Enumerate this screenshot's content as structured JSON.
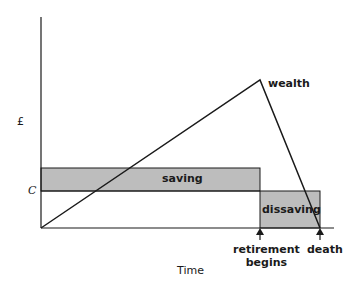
{
  "diagram": {
    "y_axis_label": "£",
    "x_axis_label": "Time",
    "consumption_label": "C",
    "wealth_label": "wealth",
    "saving_label": "saving",
    "dissaving_label": "dissaving",
    "markers": [
      {
        "label_line1": "retirement",
        "label_line2": "begins"
      },
      {
        "label_line1": "death",
        "label_line2": ""
      }
    ],
    "colors": {
      "fill": "#bdbdbd",
      "line": "#1a1a1a",
      "background": "#ffffff"
    }
  }
}
